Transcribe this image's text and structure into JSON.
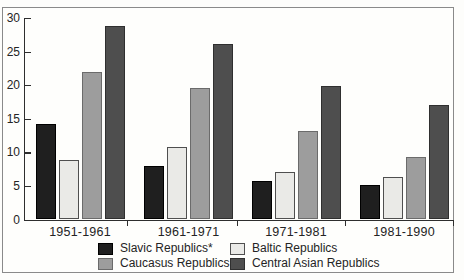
{
  "chart_data": {
    "type": "bar",
    "title": "",
    "xlabel": "",
    "ylabel": "",
    "grid": false,
    "ylim": [
      0,
      30
    ],
    "yticks": [
      0,
      5,
      10,
      15,
      20,
      25,
      30
    ],
    "categories": [
      "1951-1961",
      "1961-1971",
      "1971-1981",
      "1981-1990"
    ],
    "series": [
      {
        "name": "Slavic Republics*",
        "color": "#1f1f1f",
        "border_color": "#000000",
        "values": [
          14.2,
          8.0,
          5.8,
          5.1
        ]
      },
      {
        "name": "Baltic Republics",
        "color": "#eaeae7",
        "border_color": "#4f4f4f",
        "values": [
          8.9,
          10.8,
          7.1,
          6.4
        ]
      },
      {
        "name": "Caucasus Republics",
        "color": "#9d9d9d",
        "border_color": "#6b6b6b",
        "values": [
          22.0,
          19.6,
          13.2,
          9.3
        ]
      },
      {
        "name": "Central Asian Republics",
        "color": "#4e4e4e",
        "border_color": "#2f2f2f",
        "values": [
          28.8,
          26.2,
          19.9,
          17.1
        ]
      }
    ],
    "legend_position": "bottom",
    "legend_columns": 2
  },
  "colors": {
    "frame": "#8a8a8a",
    "axis": "#2e2e2e",
    "text": "#242424",
    "background": "#fdfdfb"
  }
}
